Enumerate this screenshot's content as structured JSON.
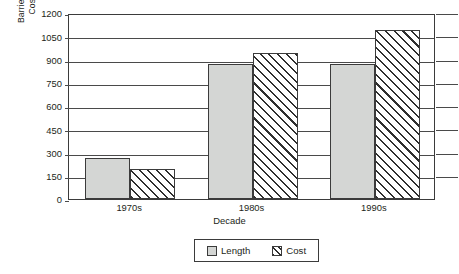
{
  "chart_data": {
    "type": "bar",
    "title": "",
    "xlabel": "Decade",
    "ylabel_line1": "Barrier Length (km)",
    "ylabel_line2": "Cost (million $)",
    "categories": [
      "1970s",
      "1980s",
      "1990s"
    ],
    "series": [
      {
        "name": "Length",
        "values": [
          265,
          870,
          870
        ],
        "color": "#d4d6d4",
        "pattern": "solid"
      },
      {
        "name": "Cost",
        "values": [
          195,
          940,
          1090
        ],
        "color": "#ffffff",
        "pattern": "diagonal-hatch"
      }
    ],
    "ylim": [
      0,
      1200
    ],
    "ytick_values": [
      0,
      150,
      300,
      450,
      600,
      750,
      900,
      1050,
      1200
    ],
    "ytick_labels": [
      "0",
      "150",
      "300",
      "450",
      "600",
      "750",
      "900",
      "1050",
      "1200"
    ],
    "grid": true,
    "grid_axis": "y",
    "legend_position": "bottom-center",
    "legend_entries": [
      "Length",
      "Cost"
    ]
  }
}
